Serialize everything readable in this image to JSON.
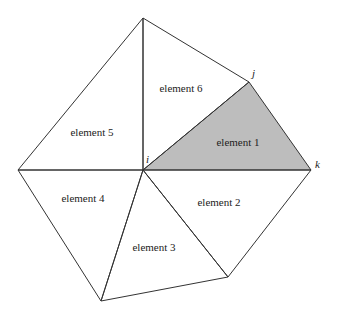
{
  "diagram": {
    "type": "finite-element-mesh",
    "colors": {
      "highlight_fill": "#bdbdbd",
      "stroke": "#333333",
      "background": "#ffffff"
    },
    "nodes": {
      "top": {
        "x": 143,
        "y": 18
      },
      "j": {
        "x": 249,
        "y": 82
      },
      "i": {
        "x": 143,
        "y": 170
      },
      "k": {
        "x": 311,
        "y": 170
      },
      "left": {
        "x": 18,
        "y": 170
      },
      "br": {
        "x": 228,
        "y": 277
      },
      "bottom": {
        "x": 101,
        "y": 301
      }
    },
    "node_labels": {
      "i": "i",
      "j": "j",
      "k": "k"
    },
    "elements": [
      {
        "id": "1",
        "label": "element 1",
        "highlighted": true
      },
      {
        "id": "2",
        "label": "element 2",
        "highlighted": false
      },
      {
        "id": "3",
        "label": "element 3",
        "highlighted": false
      },
      {
        "id": "4",
        "label": "element 4",
        "highlighted": false
      },
      {
        "id": "5",
        "label": "element 5",
        "highlighted": false
      },
      {
        "id": "6",
        "label": "element 6",
        "highlighted": false
      }
    ]
  }
}
